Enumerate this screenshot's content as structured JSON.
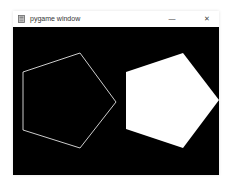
{
  "window": {
    "title": "pygame window",
    "app_icon": "pygame-icon",
    "controls": {
      "minimize": "—",
      "close": "✕"
    }
  },
  "canvas": {
    "background": "#000000",
    "shapes": [
      {
        "type": "pentagon-outline",
        "stroke": "#ffffff",
        "points": "10,45 67,26 103,75 67,121 10,103"
      },
      {
        "type": "pentagon-filled",
        "fill": "#ffffff",
        "points": "113,45 170,26 206,73 170,121 113,102"
      }
    ]
  }
}
